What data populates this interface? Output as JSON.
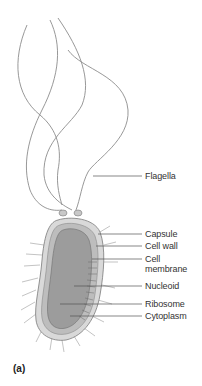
{
  "diagram": {
    "panel_label": "(a)",
    "labels": {
      "flagella": "Flagella",
      "capsule": "Capsule",
      "cell_wall": "Cell wall",
      "cell_membrane_line1": "Cell",
      "cell_membrane_line2": "membrane",
      "nucleoid": "Nucleoid",
      "ribosome": "Ribosome",
      "cytoplasm": "Cytoplasm"
    },
    "colors": {
      "line": "#8a8a8a",
      "leader": "#555555",
      "capsule": "#d8d8d8",
      "wall": "#bfbfbf",
      "cytoplasm": "#9a9a9a",
      "text": "#333333"
    }
  }
}
